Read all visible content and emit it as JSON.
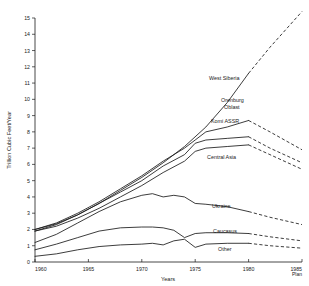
{
  "chart_data": {
    "type": "line",
    "title": "",
    "xlabel": "Years",
    "ylabel": "Trillion Cubic Feet/Year",
    "xlim": [
      1960,
      1985
    ],
    "ylim": [
      0,
      15
    ],
    "grid": false,
    "legend_position": "inline-labels",
    "x_tick_labels": [
      "1960",
      "1965",
      "1970",
      "1975",
      "1980",
      "1985"
    ],
    "x_ticks": [
      1960,
      1965,
      1970,
      1975,
      1980,
      1985
    ],
    "x_tick_sublabel": "Plan",
    "y_tick_labels": [
      "0",
      "1",
      "2",
      "3",
      "4",
      "5",
      "6",
      "7",
      "8",
      "9",
      "10",
      "11",
      "12",
      "13",
      "14",
      "15"
    ],
    "y_ticks": [
      0,
      1,
      2,
      3,
      4,
      5,
      6,
      7,
      8,
      9,
      10,
      11,
      12,
      13,
      14,
      15
    ],
    "projection_start_year": 1980,
    "projection_note": "dashed segments are planned/projected values to 1985",
    "series": [
      {
        "name": "West Siberia",
        "label": "West Siberia",
        "x": [
          1960,
          1962,
          1964,
          1966,
          1968,
          1970,
          1972,
          1974,
          1976,
          1978,
          1980,
          1982,
          1985
        ],
        "values": [
          1.9,
          2.3,
          2.9,
          3.6,
          4.4,
          5.2,
          6.1,
          7.1,
          8.3,
          9.8,
          11.6,
          13.2,
          15.4
        ],
        "projected_x": [
          1980,
          1982,
          1985
        ],
        "projected_values": [
          11.6,
          13.2,
          15.4
        ]
      },
      {
        "name": "Orenburg Oblast",
        "label": "Orenburg Oblast",
        "x": [
          1960,
          1962,
          1964,
          1966,
          1968,
          1970,
          1972,
          1974,
          1975,
          1976,
          1978,
          1980,
          1982,
          1985
        ],
        "values": [
          2.0,
          2.4,
          3.0,
          3.7,
          4.5,
          5.3,
          6.2,
          7.0,
          7.5,
          8.0,
          8.3,
          8.7,
          8.0,
          6.9
        ],
        "projected_x": [
          1980,
          1982,
          1985
        ],
        "projected_values": [
          8.7,
          8.0,
          6.9
        ]
      },
      {
        "name": "Komi ASSR",
        "label": "Komi ASSR",
        "x": [
          1960,
          1962,
          1964,
          1966,
          1968,
          1970,
          1972,
          1974,
          1975,
          1976,
          1978,
          1980,
          1982,
          1985
        ],
        "values": [
          2.0,
          2.35,
          2.9,
          3.6,
          4.3,
          5.0,
          5.9,
          6.6,
          7.3,
          7.5,
          7.6,
          7.7,
          7.0,
          6.1
        ],
        "projected_x": [
          1980,
          1982,
          1985
        ],
        "projected_values": [
          7.7,
          7.0,
          6.1
        ]
      },
      {
        "name": "Central Asia",
        "label": "Central Asia",
        "x": [
          1960,
          1962,
          1964,
          1966,
          1968,
          1970,
          1972,
          1974,
          1975,
          1976,
          1978,
          1980,
          1982,
          1985
        ],
        "values": [
          1.9,
          2.2,
          2.7,
          3.3,
          4.0,
          4.7,
          5.5,
          6.2,
          6.8,
          7.0,
          7.1,
          7.2,
          6.6,
          5.7
        ],
        "projected_x": [
          1980,
          1982,
          1985
        ],
        "projected_values": [
          7.2,
          6.6,
          5.7
        ]
      },
      {
        "name": "Ukraine",
        "label": "Ukraine",
        "x": [
          1960,
          1962,
          1964,
          1966,
          1968,
          1970,
          1971,
          1972,
          1973,
          1974,
          1975,
          1976,
          1978,
          1980,
          1982,
          1985
        ],
        "values": [
          1.2,
          1.7,
          2.4,
          3.1,
          3.7,
          4.1,
          4.2,
          4.0,
          4.1,
          4.0,
          3.6,
          3.55,
          3.4,
          3.1,
          2.75,
          2.3
        ],
        "projected_x": [
          1980,
          1982,
          1985
        ],
        "projected_values": [
          3.1,
          2.75,
          2.3
        ]
      },
      {
        "name": "Caucasus",
        "label": "Caucasus",
        "x": [
          1960,
          1962,
          1964,
          1966,
          1968,
          1970,
          1971,
          1972,
          1973,
          1974,
          1975,
          1976,
          1978,
          1980,
          1982,
          1985
        ],
        "values": [
          0.75,
          1.1,
          1.5,
          1.9,
          2.1,
          2.15,
          2.15,
          2.1,
          1.95,
          1.5,
          1.75,
          1.8,
          1.8,
          1.75,
          1.55,
          1.3
        ],
        "projected_x": [
          1980,
          1982,
          1985
        ],
        "projected_values": [
          1.75,
          1.55,
          1.3
        ]
      },
      {
        "name": "Other",
        "label": "Other",
        "x": [
          1960,
          1962,
          1964,
          1966,
          1968,
          1970,
          1971,
          1972,
          1973,
          1974,
          1975,
          1976,
          1978,
          1980,
          1982,
          1985
        ],
        "values": [
          0.35,
          0.5,
          0.75,
          0.95,
          1.05,
          1.1,
          1.15,
          1.05,
          1.3,
          1.4,
          0.9,
          1.1,
          1.15,
          1.15,
          1.0,
          0.85
        ],
        "projected_x": [
          1980,
          1982,
          1985
        ],
        "projected_values": [
          1.15,
          1.0,
          0.85
        ]
      }
    ]
  },
  "axes": {
    "y_title": "Trillion Cubic Feet/Year",
    "x_title": "Years",
    "plan_marker": "Plan"
  },
  "labels": {
    "west_siberia": "West Siberia",
    "orenburg_line1": "Orenburg",
    "orenburg_line2": "Oblast",
    "komi": "Komi ASSR",
    "central_asia": "Central Asia",
    "ukraine": "Ukraine",
    "caucasus": "Caucasus",
    "other": "Other"
  },
  "ticks": {
    "x": [
      "1960",
      "1965",
      "1970",
      "1975",
      "1980",
      "1985"
    ],
    "y": [
      "0",
      "1",
      "2",
      "3",
      "4",
      "5",
      "6",
      "7",
      "8",
      "9",
      "10",
      "11",
      "12",
      "13",
      "14",
      "15"
    ]
  },
  "colors": {
    "ink": "#1a1a1a",
    "background": "#ffffff"
  }
}
